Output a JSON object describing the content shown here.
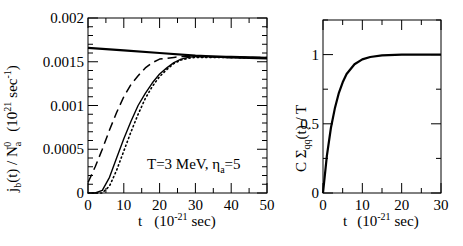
{
  "chart_data": [
    {
      "type": "line",
      "title": "",
      "xlabel": "t   (10^-21 sec)",
      "ylabel": "j_b(t) / N_a^0   (10^21 sec^-1)",
      "xlim": [
        0,
        50
      ],
      "ylim": [
        0,
        0.002
      ],
      "xticks": [
        "0",
        "10",
        "20",
        "30",
        "40",
        "50"
      ],
      "yticks": [
        "0",
        "0.0005",
        "0.001",
        "0.0015",
        "0.002"
      ],
      "annotation": "T=3 MeV, η_a=5",
      "grid": false,
      "legend": null,
      "series": [
        {
          "name": "solid-flat",
          "style": "solid-thick",
          "x": [
            0,
            10,
            20,
            30,
            40,
            50
          ],
          "y": [
            0.00166,
            0.00163,
            0.0016,
            0.00157,
            0.00155,
            0.00154
          ]
        },
        {
          "name": "dashed",
          "style": "dashed",
          "x": [
            0,
            2,
            4,
            6,
            8,
            10,
            12,
            14,
            16,
            18,
            20,
            22,
            24,
            26,
            30,
            40,
            50
          ],
          "y": [
            0.00012,
            0.0003,
            0.0005,
            0.00072,
            0.00092,
            0.0011,
            0.00124,
            0.00134,
            0.00143,
            0.00149,
            0.00153,
            0.00154,
            0.00155,
            0.00156,
            0.00156,
            0.00155,
            0.00155
          ]
        },
        {
          "name": "solid-thin",
          "style": "solid",
          "x": [
            0,
            2,
            4,
            6,
            8,
            10,
            12,
            14,
            16,
            18,
            20,
            22,
            24,
            26,
            28,
            30,
            40,
            50
          ],
          "y": [
            0,
            0,
            3e-05,
            0.00018,
            0.0004,
            0.00062,
            0.00082,
            0.001,
            0.00114,
            0.00126,
            0.00136,
            0.00143,
            0.00149,
            0.00153,
            0.00155,
            0.00156,
            0.00156,
            0.00155
          ]
        },
        {
          "name": "dotted",
          "style": "dotted",
          "x": [
            0,
            4,
            6,
            8,
            10,
            12,
            14,
            16,
            18,
            20,
            22,
            24,
            26,
            28,
            30,
            40,
            50
          ],
          "y": [
            0,
            0,
            8e-05,
            0.00026,
            0.00048,
            0.0007,
            0.0009,
            0.00108,
            0.00122,
            0.00133,
            0.00141,
            0.00148,
            0.00152,
            0.00154,
            0.00155,
            0.00155,
            0.00154
          ]
        }
      ]
    },
    {
      "type": "line",
      "title": "",
      "xlabel": "t   (10^-21 sec)",
      "ylabel": "C Σ_qq(t) / T",
      "xlim": [
        0,
        30
      ],
      "ylim": [
        0,
        1.25
      ],
      "xticks": [
        "0",
        "10",
        "20",
        "30"
      ],
      "yticks": [
        "0",
        "0.5",
        "1"
      ],
      "grid": false,
      "legend": null,
      "series": [
        {
          "name": "sigma",
          "style": "solid-thick",
          "x": [
            0,
            1,
            2,
            3,
            4,
            5,
            6,
            8,
            10,
            12,
            15,
            20,
            25,
            30
          ],
          "y": [
            0,
            0.27,
            0.47,
            0.61,
            0.72,
            0.8,
            0.86,
            0.93,
            0.965,
            0.983,
            0.994,
            0.999,
            1.0,
            1.0
          ]
        }
      ]
    }
  ],
  "labels": {
    "left": {
      "ytick_labels": [
        "0",
        "0.0005",
        "0.001",
        "0.0015",
        "0.002"
      ],
      "xtick_labels": [
        "0",
        "10",
        "20",
        "30",
        "40",
        "50"
      ],
      "xlabel_t": "t",
      "xlabel_paren_open": "(10",
      "xlabel_exp": "-21",
      "xlabel_unit": "sec)",
      "ylabel_j": "j",
      "ylabel_b": "b",
      "ylabel_mid": "(t) / N",
      "ylabel_a": "a",
      "ylabel_0": "0",
      "ylabel_unit_open": "(10",
      "ylabel_21": "21",
      "ylabel_sec": "sec",
      "ylabel_m1": "-1",
      "ylabel_close": ")",
      "annot_main": "T=3 MeV, η",
      "annot_sub": "a",
      "annot_eq": "=5"
    },
    "right": {
      "ytick_labels": [
        "0",
        "0.5",
        "1"
      ],
      "xtick_labels": [
        "0",
        "10",
        "20",
        "30"
      ],
      "xlabel_t": "t",
      "xlabel_paren_open": "(10",
      "xlabel_exp": "-21",
      "xlabel_unit": "sec)",
      "ylabel_main": "C Σ",
      "ylabel_sub": "qq",
      "ylabel_rest": "(t) / T"
    }
  }
}
